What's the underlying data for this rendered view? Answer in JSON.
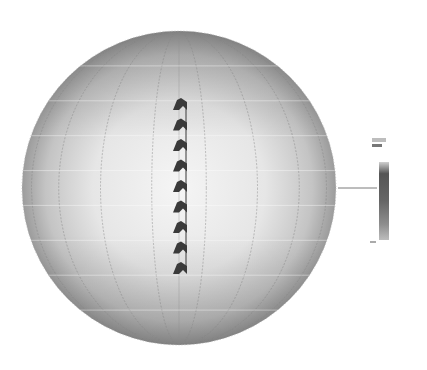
{
  "figure": {
    "sphere": {
      "cx": 179,
      "cy": 188,
      "r": 157,
      "color_center": "#f4f4f4",
      "color_edge": "#9a9a9a",
      "grid_color": "#8a8a8a",
      "meridians": 9,
      "parallels": 9
    },
    "array": {
      "x": 180,
      "y_start": 104,
      "y_end": 268,
      "element_count": 9,
      "element_color": "#3a3a3a"
    },
    "leader_line": {
      "x1": 338,
      "y1": 188,
      "x2": 377,
      "y2": 188,
      "color": "#777777"
    },
    "legend": {
      "x": 377,
      "y": 160,
      "width": 10,
      "height": 80,
      "top_label": "",
      "bottom_label": "",
      "gradient": [
        "#cfcfcf",
        "#555555",
        "#6a6a6a",
        "#9a9a9a",
        "#bdbdbd"
      ]
    }
  }
}
